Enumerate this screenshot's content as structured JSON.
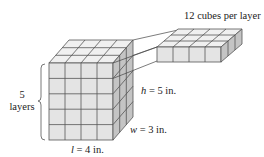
{
  "labels": {
    "cubes_per_layer": "12 cubes per layer",
    "layers_count": "5",
    "layers_word": "layers",
    "height_var": "h",
    "height_val": " = 5 in.",
    "width_var": "w",
    "width_val": " = 3 in.",
    "length_var": "l",
    "length_val": " = 4 in."
  },
  "dimensions": {
    "length": 4,
    "width": 3,
    "height": 5,
    "unit": "in."
  },
  "colors": {
    "front_face": "#e4e4e4",
    "top_face": "#f0f0f0",
    "side_face": "#c4c4c4",
    "edge": "#555555"
  }
}
